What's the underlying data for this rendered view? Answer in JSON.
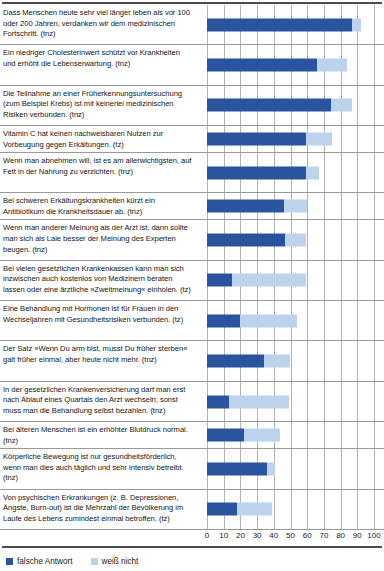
{
  "chart_data": {
    "type": "bar",
    "orientation": "horizontal",
    "stacked": true,
    "title": "",
    "xlabel": "",
    "ylabel": "",
    "xlim": [
      0,
      100
    ],
    "xticks": [
      "0",
      "10",
      "20",
      "30",
      "40",
      "50",
      "60",
      "70",
      "80",
      "90",
      "100"
    ],
    "grid": true,
    "legend_position": "bottom-left",
    "legend": [
      {
        "label": "falsche Antwort",
        "color": "#2a549d"
      },
      {
        "label": "weiß nicht",
        "color": "#bcd2ed"
      }
    ],
    "series": [
      {
        "name": "falsche Antwort",
        "color": "#2a549d",
        "values": [
          87,
          66,
          74,
          59,
          59,
          46,
          47,
          15,
          20,
          34,
          13,
          22,
          36,
          18
        ]
      },
      {
        "name": "weiß nicht",
        "color": "#bcd2ed",
        "values": [
          5,
          18,
          13,
          16,
          8,
          14,
          12,
          44,
          34,
          16,
          36,
          22,
          5,
          21
        ]
      }
    ],
    "categories": [
      "Dass Menschen heute sehr viel länger leben als vor 100 oder 200 Jahren, verdanken wir dem medizinischen Fortschritt. (tnz)",
      "Ein niedriger Cholesterinwert schützt vor Krankheiten und erhöht die Lebenserwartung. (tnz)",
      "Die Teilnahme an einer Früherkennungsuntersuchung (zum Beispiel Krebs) ist mit keinerlei medizinischen Risiken verbunden. (tnz)",
      "Vitamin C hat keinen nachweisbaren Nutzen zur Vorbeugung gegen Erkältungen. (tz)",
      "Wenn man abnehmen will, ist es am allerwichtigsten, auf Fett in der Nahrung zu verzichten. (tnz)",
      "Bei schweren Erkältungskrankheiten kürzt ein Antibiotikum die Krankheitsdauer ab. (tnz)",
      "Wenn man anderer Meinung als der Arzt ist, dann sollte man sich als Laie besser der Meinung des Experten beugen. (tnz)",
      "Bei vielen gesetzlichen Krankenkassen kann man sich inzwischen auch kostenlos von Medizinern beraten lassen oder eine ärztliche »Zweitmeinung« einholen. (tz)",
      "Eine Behandlung mit Hormonen ist für Frauen in den Wechseljahren mit Gesundheitsrisiken verbunden. (tz)",
      "Der Satz »Wenn Du arm bist, musst Du früher sterben« galt früher einmal, aber heute nicht mehr. (tnz)",
      "In der gesetzlichen Krankenversicherung darf man erst nach Ablauf eines Quartals den Arzt wechseln; sonst muss man die Behandlung selbst bezahlen. (tnz)",
      "Bei älteren Menschen ist ein erhöhter Blutdruck normal. (tnz)",
      "Körperliche Bewegung ist nur gesundheitsförderlich, wenn man dies auch täglich und sehr intensiv betreibt. (tnz)",
      "Von psychischen Erkrankungen (z. B. Depressionen, Ängste, Burn-out) ist die Mehrzahl der Bevölkerung im Laufe des Lebens zumindest einmal betroffen. (tz)"
    ],
    "rows": [
      {
        "label": "Dass Menschen heute sehr viel länger leben als vor 100 oder 200 Jahren, verdanken wir dem medizinischen Fortschritt. (tnz)",
        "lines": 3,
        "falsche_antwort": 87,
        "weiss_nicht": 5
      },
      {
        "label": "Ein niedriger Cholesterinwert schützt vor Krankheiten und erhöht die Lebenserwartung. (tnz)",
        "lines": 3,
        "falsche_antwort": 66,
        "weiss_nicht": 18
      },
      {
        "label": "Die Teilnahme an einer Früherkennungsuntersuchung (zum Beispiel Krebs) ist mit keinerlei medizinischen Risiken verbunden. (tnz)",
        "lines": 3,
        "falsche_antwort": 74,
        "weiss_nicht": 13
      },
      {
        "label": "Vitamin C hat keinen nachweisbaren Nutzen zur Vorbeugung gegen Erkältungen. (tz)",
        "lines": 2,
        "falsche_antwort": 59,
        "weiss_nicht": 16
      },
      {
        "label": "Wenn man abnehmen will, ist es am allerwichtigsten, auf Fett in der Nahrung zu verzichten. (tnz)",
        "lines": 3,
        "falsche_antwort": 59,
        "weiss_nicht": 8
      },
      {
        "label": "Bei schweren Erkältungskrankheiten kürzt ein Antibiotikum die Krankheitsdauer ab. (tnz)",
        "lines": 2,
        "falsche_antwort": 46,
        "weiss_nicht": 14
      },
      {
        "label": "Wenn man anderer Meinung als der Arzt ist, dann sollte man sich als Laie besser der Meinung des Experten beugen. (tnz)",
        "lines": 3,
        "falsche_antwort": 47,
        "weiss_nicht": 12
      },
      {
        "label": "Bei vielen gesetzlichen Krankenkassen kann man sich inzwischen auch kostenlos von Medizinern beraten lassen oder eine ärztliche »Zweitmeinung« einholen. (tz)",
        "lines": 3,
        "falsche_antwort": 15,
        "weiss_nicht": 44
      },
      {
        "label": "Eine Behandlung mit Hormonen ist für Frauen in den Wechseljahren mit Gesundheitsrisiken verbunden. (tz)",
        "lines": 3,
        "falsche_antwort": 20,
        "weiss_nicht": 34
      },
      {
        "label": "Der Satz »Wenn Du arm bist, musst Du früher sterben« galt früher einmal, aber heute nicht mehr. (tnz)",
        "lines": 3,
        "falsche_antwort": 34,
        "weiss_nicht": 16
      },
      {
        "label": "In der gesetzlichen Krankenversicherung darf man erst nach Ablauf eines Quartals den Arzt wechseln; sonst muss man die Behandlung selbst bezahlen. (tnz)",
        "lines": 3,
        "falsche_antwort": 13,
        "weiss_nicht": 36
      },
      {
        "label": "Bei älteren Menschen ist ein erhöhter Blutdruck normal. (tnz)",
        "lines": 2,
        "falsche_antwort": 22,
        "weiss_nicht": 22
      },
      {
        "label": "Körperliche Bewegung ist nur gesundheitsförderlich, wenn man dies auch täglich und sehr intensiv betreibt. (tnz)",
        "lines": 3,
        "falsche_antwort": 36,
        "weiss_nicht": 5
      },
      {
        "label": "Von psychischen Erkrankungen (z. B. Depressionen, Ängste, Burn-out) ist die Mehrzahl der Bevölkerung im Laufe des Lebens zumindest einmal betroffen. (tz)",
        "lines": 3,
        "falsche_antwort": 18,
        "weiss_nicht": 21
      }
    ]
  }
}
